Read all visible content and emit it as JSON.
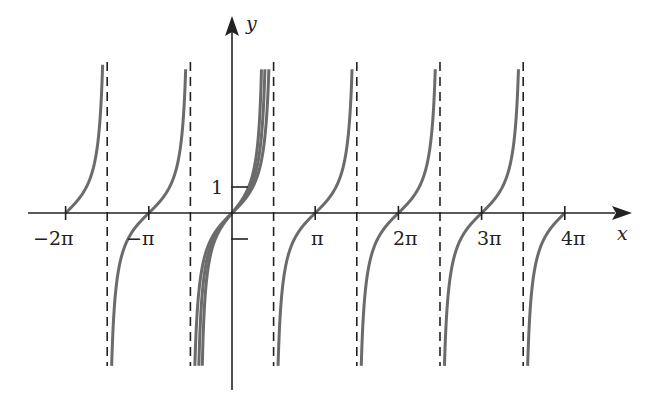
{
  "chart_data": {
    "type": "line",
    "title": "",
    "xlabel": "x",
    "ylabel": "y",
    "x_ticks": [
      {
        "label": "−2π",
        "value": -6.2832
      },
      {
        "label": "−π",
        "value": -3.1416
      },
      {
        "label": "π",
        "value": 3.1416
      },
      {
        "label": "2π",
        "value": 6.2832
      },
      {
        "label": "3π",
        "value": 9.4248
      },
      {
        "label": "4π",
        "value": 12.5664
      }
    ],
    "y_ticks": [
      {
        "label": "1",
        "value": 1
      },
      {
        "label": "",
        "value": -1
      }
    ],
    "asymptotes_x": [
      "-3π/2",
      "-π/2",
      "π/2",
      "3π/2",
      "5π/2",
      "7π/2"
    ],
    "series": [
      {
        "name": "y = tan x",
        "description": "branches crossing x-axis at nπ, n=-2..4"
      },
      {
        "name": "central curve 2",
        "description": "steeper curve through origin on central branch"
      },
      {
        "name": "central curve 3",
        "description": "steepest curve through origin on central branch"
      }
    ],
    "grid": false,
    "legend": "none"
  },
  "labels": {
    "x_axis": "x",
    "y_axis": "y",
    "tick_neg2pi": "−2π",
    "tick_negpi": "−π",
    "tick_pi": "π",
    "tick_2pi": "2π",
    "tick_3pi": "3π",
    "tick_4pi": "4π",
    "tick_1": "1"
  },
  "colors": {
    "curve": "#6b6b6b",
    "axis": "#222222",
    "asymptote": "#222222"
  }
}
